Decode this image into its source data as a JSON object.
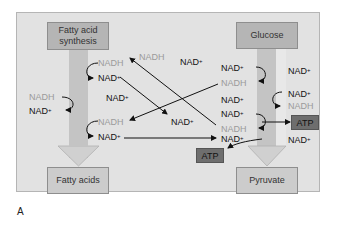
{
  "figure": {
    "caption": "A",
    "colors": {
      "panel_bg": "#e2e2e2",
      "box_bg": "#b5b5b5",
      "atp_bg": "#6e6e6e",
      "nadh_text": "#9a9a9a",
      "nad_text": "#111111",
      "shaft": "#c4c4c4"
    }
  },
  "boxes": {
    "fatty_acid_synthesis": "Fatty acid\nsynthesis",
    "fatty_acid_synthesis_line1": "Fatty acid",
    "fatty_acid_synthesis_line2": "synthesis",
    "glucose": "Glucose",
    "fatty_acids": "Fatty acids",
    "pyruvate": "Pyruvate",
    "atp_right": "ATP",
    "atp_center": "ATP"
  },
  "labels": {
    "nadh": "NADH",
    "nad": "NAD",
    "plus": "+"
  },
  "left_pathway": [
    {
      "side": "right",
      "from": "NADH",
      "to": "NAD+"
    },
    {
      "side": "left",
      "from": "NADH",
      "to": "NAD+"
    },
    {
      "side": "right",
      "from": "NADH",
      "to": "NAD+"
    }
  ],
  "right_pathway": [
    {
      "side": "left",
      "from": "NAD+",
      "to": "NADH"
    },
    {
      "side": "right",
      "from": "NAD+",
      "to": "NADH"
    },
    {
      "side": "left",
      "from": "NAD+",
      "to": "NADH",
      "produces": "ATP"
    }
  ],
  "free_labels": [
    "NADH",
    "NAD+",
    "NAD+",
    "NAD+",
    "NAD+",
    "NAD+",
    "NAD+"
  ]
}
